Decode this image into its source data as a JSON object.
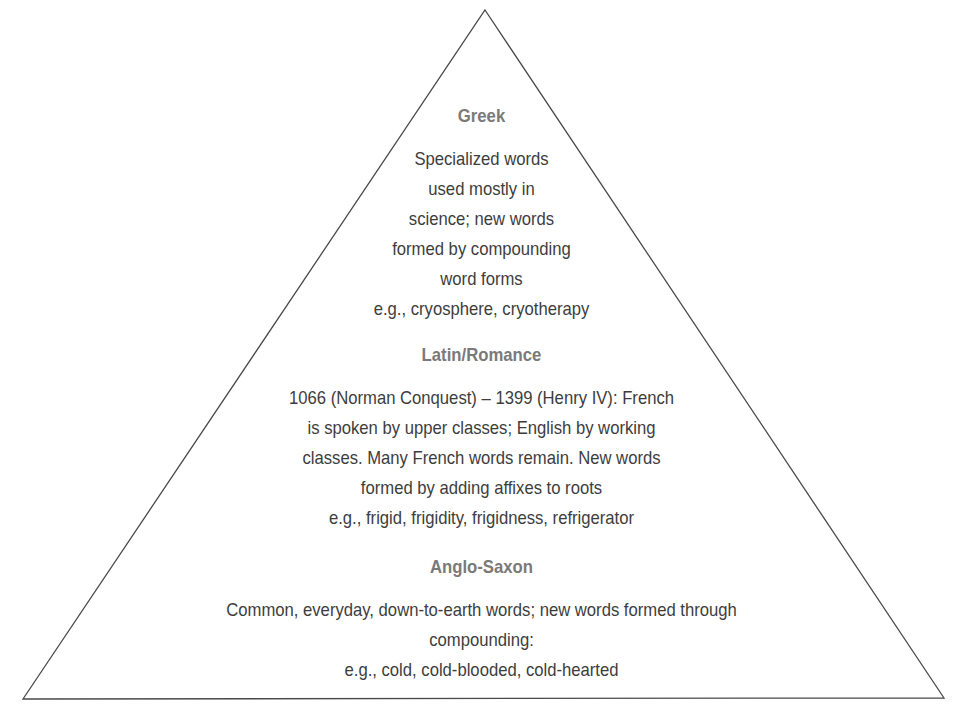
{
  "diagram": {
    "shape": "pyramid",
    "stroke_color": "#4a4a4a",
    "heading_color": "#7a7a7a",
    "text_color": "#3d3d3d",
    "levels": [
      {
        "title": "Greek",
        "lines": [
          "Specialized words",
          "used mostly in",
          "science; new words",
          "formed by compounding",
          "word forms",
          "e.g., cryosphere, cryotherapy"
        ]
      },
      {
        "title": "Latin/Romance",
        "lines": [
          "1066 (Norman Conquest) – 1399 (Henry IV): French",
          "is spoken by upper classes; English by working",
          "classes. Many French words remain. New words",
          "formed by adding affixes to roots",
          "e.g., frigid, frigidity, frigidness, refrigerator"
        ]
      },
      {
        "title": "Anglo-Saxon",
        "lines": [
          "Common, everyday, down-to-earth words; new words formed through",
          "compounding:",
          "e.g., cold, cold-blooded, cold-hearted"
        ]
      }
    ]
  }
}
